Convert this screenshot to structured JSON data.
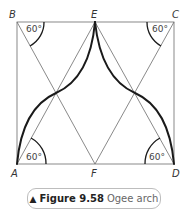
{
  "figure": {
    "number_label": "Figure 9.58",
    "title": "Ogee arch",
    "marker": "▲"
  },
  "points": {
    "A": "A",
    "B": "B",
    "C": "C",
    "D": "D",
    "E": "E",
    "F": "F"
  },
  "angles": {
    "top_left": "60°",
    "top_right": "60°",
    "bottom_left": "60°",
    "bottom_right": "60°"
  },
  "colors": {
    "construction_line": "#6b6b6b",
    "arch_curve": "#1a1a1a",
    "caption_border": "#bdbdbd"
  }
}
